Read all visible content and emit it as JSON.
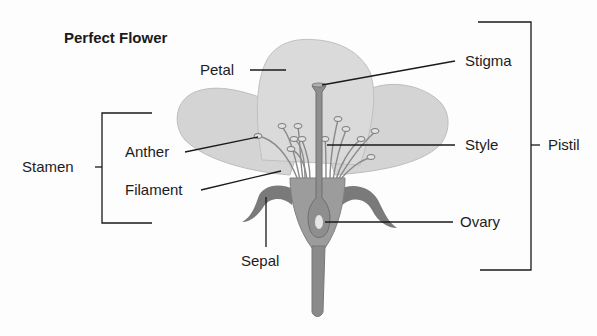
{
  "title": "Perfect Flower",
  "labels": {
    "petal": "Petal",
    "stigma": "Stigma",
    "style": "Style",
    "pistil": "Pistil",
    "stamen": "Stamen",
    "anther": "Anther",
    "filament": "Filament",
    "sepal": "Sepal",
    "ovary": "Ovary"
  },
  "colors": {
    "petal_fill": "#d6d6d6",
    "petal_shade": "#c4c4c4",
    "receptacle_fill": "#9a9a9a",
    "sepal_fill": "#7d7d7d",
    "pistil_fill": "#8c8c8c",
    "ovule_fill": "#e4e4e4",
    "line": "#1a1a1a"
  }
}
